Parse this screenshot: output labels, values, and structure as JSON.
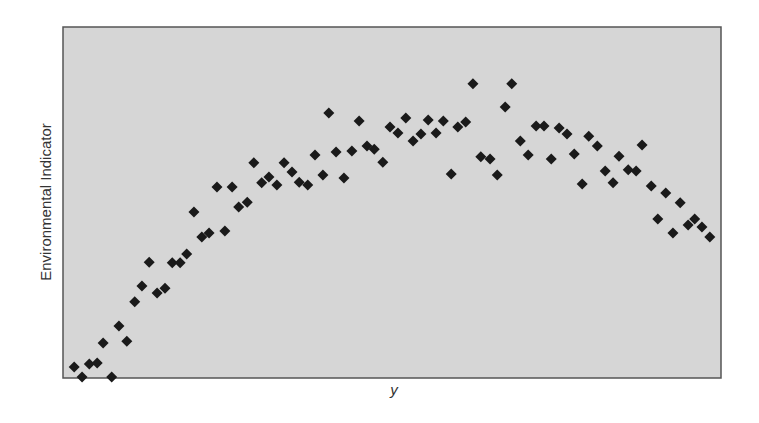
{
  "chart_data": {
    "type": "scatter",
    "title": "",
    "xlabel": "y",
    "ylabel": "Environmental Indicator",
    "xlim": [
      0,
      100
    ],
    "ylim": [
      0,
      100
    ],
    "grid": false,
    "legend": null,
    "x_ticks": [],
    "y_ticks": [],
    "marker": "diamond",
    "colors": {
      "background": "#d6d6d6",
      "border": "#555555",
      "marker": "#1a1a1a"
    },
    "series": [
      {
        "name": "observations",
        "points": [
          [
            1.7,
            3.1
          ],
          [
            2.9,
            0.3
          ],
          [
            4.0,
            4.0
          ],
          [
            5.2,
            4.3
          ],
          [
            6.1,
            10.0
          ],
          [
            7.4,
            0.3
          ],
          [
            8.5,
            14.8
          ],
          [
            9.7,
            10.5
          ],
          [
            10.9,
            21.7
          ],
          [
            12.0,
            26.2
          ],
          [
            13.1,
            33.0
          ],
          [
            14.3,
            24.2
          ],
          [
            15.5,
            25.6
          ],
          [
            16.6,
            32.8
          ],
          [
            17.8,
            32.8
          ],
          [
            18.8,
            35.3
          ],
          [
            19.9,
            47.3
          ],
          [
            21.1,
            40.2
          ],
          [
            22.2,
            41.3
          ],
          [
            23.4,
            54.4
          ],
          [
            24.6,
            41.9
          ],
          [
            25.7,
            54.4
          ],
          [
            26.7,
            48.7
          ],
          [
            28.0,
            50.1
          ],
          [
            29.0,
            61.3
          ],
          [
            30.2,
            55.6
          ],
          [
            31.3,
            57.3
          ],
          [
            32.5,
            55.0
          ],
          [
            33.6,
            61.3
          ],
          [
            34.8,
            58.7
          ],
          [
            35.9,
            55.8
          ],
          [
            37.2,
            55.0
          ],
          [
            38.3,
            63.5
          ],
          [
            39.5,
            57.8
          ],
          [
            40.4,
            75.5
          ],
          [
            41.5,
            64.4
          ],
          [
            42.7,
            57.0
          ],
          [
            43.9,
            64.7
          ],
          [
            45.0,
            73.2
          ],
          [
            46.2,
            66.1
          ],
          [
            47.3,
            65.2
          ],
          [
            48.6,
            61.5
          ],
          [
            49.7,
            71.5
          ],
          [
            50.9,
            69.8
          ],
          [
            52.1,
            74.1
          ],
          [
            53.2,
            67.5
          ],
          [
            54.4,
            69.5
          ],
          [
            55.5,
            73.5
          ],
          [
            56.7,
            69.8
          ],
          [
            57.8,
            73.2
          ],
          [
            59.0,
            58.1
          ],
          [
            60.0,
            71.5
          ],
          [
            61.2,
            72.9
          ],
          [
            62.3,
            83.8
          ],
          [
            63.5,
            63.0
          ],
          [
            64.9,
            62.4
          ],
          [
            66.0,
            57.8
          ],
          [
            67.2,
            77.2
          ],
          [
            68.2,
            83.8
          ],
          [
            69.5,
            67.5
          ],
          [
            70.7,
            63.5
          ],
          [
            71.9,
            71.8
          ],
          [
            73.1,
            71.8
          ],
          [
            74.2,
            62.4
          ],
          [
            75.4,
            71.2
          ],
          [
            76.6,
            69.5
          ],
          [
            77.7,
            63.8
          ],
          [
            78.9,
            55.3
          ],
          [
            79.9,
            68.9
          ],
          [
            81.2,
            66.1
          ],
          [
            82.4,
            59.0
          ],
          [
            83.6,
            55.6
          ],
          [
            84.5,
            63.2
          ],
          [
            85.9,
            59.3
          ],
          [
            87.1,
            59.0
          ],
          [
            88.0,
            66.4
          ],
          [
            89.4,
            54.7
          ],
          [
            90.4,
            45.3
          ],
          [
            91.6,
            52.7
          ],
          [
            92.7,
            41.3
          ],
          [
            93.8,
            49.9
          ],
          [
            95.0,
            43.6
          ],
          [
            96.0,
            45.3
          ],
          [
            97.1,
            43.0
          ],
          [
            98.3,
            40.2
          ]
        ]
      }
    ]
  }
}
